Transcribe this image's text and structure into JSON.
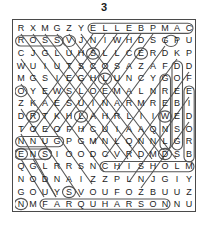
{
  "title": "3",
  "grid": {
    "rows": 15,
    "cols": 15,
    "letters": [
      [
        "R",
        "X",
        "M",
        "G",
        "Z",
        "Y",
        "E",
        "L",
        "L",
        "E",
        "B",
        "P",
        "M",
        "A",
        "C"
      ],
      [
        "R",
        "O",
        "S",
        "S",
        "V",
        "J",
        "N",
        "I",
        "W",
        "H",
        "D",
        "S",
        "G",
        "P",
        "U"
      ],
      [
        "C",
        "J",
        "G",
        "L",
        "U",
        "H",
        "S",
        "L",
        "L",
        "C",
        "E",
        "R",
        "D",
        "K",
        "P"
      ],
      [
        "W",
        "U",
        "I",
        "U",
        "T",
        "S",
        "C",
        "O",
        "S",
        "A",
        "Z",
        "A",
        "F",
        "D",
        "D"
      ],
      [
        "M",
        "G",
        "S",
        "I",
        "E",
        "G",
        "H",
        "L",
        "U",
        "N",
        "C",
        "Y",
        "G",
        "O",
        "F"
      ],
      [
        "O",
        "Y",
        "E",
        "W",
        "S",
        "L",
        "O",
        "E",
        "M",
        "A",
        "L",
        "N",
        "R",
        "E",
        "E"
      ],
      [
        "Z",
        "K",
        "A",
        "E",
        "S",
        "U",
        "I",
        "N",
        "A",
        "R",
        "M",
        "R",
        "E",
        "B",
        "I"
      ],
      [
        "D",
        "R",
        "T",
        "K",
        "H",
        "L",
        "A",
        "H",
        "R",
        "L",
        "I",
        "I",
        "W",
        "E",
        "D"
      ],
      [
        "T",
        "O",
        "E",
        "O",
        "F",
        "H",
        "C",
        "U",
        "I",
        "A",
        "A",
        "Q",
        "N",
        "S",
        "O"
      ],
      [
        "N",
        "N",
        "U",
        "G",
        "P",
        "G",
        "M",
        "N",
        "L",
        "Q",
        "N",
        "N",
        "L",
        "G",
        "R"
      ],
      [
        "E",
        "N",
        "S",
        "I",
        "O",
        "O",
        "D",
        "C",
        "V",
        "R",
        "D",
        "M",
        "D",
        "S",
        "B"
      ],
      [
        "Q",
        "G",
        "L",
        "R",
        "R",
        "S",
        "N",
        "C",
        "H",
        "I",
        "S",
        "H",
        "O",
        "L",
        "M"
      ],
      [
        "N",
        "O",
        "D",
        "N",
        "A",
        "I",
        "Z",
        "Z",
        "P",
        "L",
        "N",
        "J",
        "G",
        "I",
        "Y"
      ],
      [
        "G",
        "O",
        "U",
        "Y",
        "S",
        "V",
        "O",
        "U",
        "F",
        "O",
        "Z",
        "B",
        "U",
        "U",
        "Z"
      ],
      [
        "N",
        "M",
        "F",
        "A",
        "R",
        "Q",
        "U",
        "H",
        "A",
        "R",
        "S",
        "O",
        "N",
        "N",
        "U"
      ]
    ]
  },
  "found_words": [
    {
      "text": "CAMPBELL",
      "start_row": 0,
      "start_col": 14,
      "end_row": 0,
      "end_col": 6,
      "direction": "left"
    },
    {
      "text": "ROSS",
      "start_row": 1,
      "start_col": 0,
      "end_row": 1,
      "end_col": 3,
      "direction": "right"
    },
    {
      "text": "CHISHOLM",
      "start_row": 11,
      "start_col": 7,
      "end_row": 11,
      "end_col": 14,
      "direction": "right"
    },
    {
      "text": "FARQUHARSON",
      "start_row": 14,
      "start_col": 2,
      "end_row": 14,
      "end_col": 12,
      "direction": "right"
    },
    {
      "text": "GORDON",
      "start_row": 4,
      "start_col": 12,
      "end_row": 9,
      "end_col": 14,
      "direction": "down"
    },
    {
      "text": "FORBES",
      "start_row": 3,
      "start_col": 12,
      "end_row": 10,
      "end_col": 14,
      "direction": "down"
    },
    {
      "text": "ANDERSON",
      "start_row": 3,
      "start_col": 13,
      "end_row": 10,
      "end_col": 13,
      "direction": "down"
    },
    {
      "text": "NNUG",
      "start_row": 9,
      "start_col": 0,
      "end_row": 9,
      "end_col": 3,
      "direction": "right"
    },
    {
      "text": "ENS",
      "start_row": 10,
      "start_col": 0,
      "end_row": 10,
      "end_col": 2,
      "direction": "right"
    }
  ],
  "colors": {
    "ink": "#1c1c1c",
    "border": "#4a4a4a",
    "mark": "#555555",
    "paper": "#ffffff"
  },
  "icons": {
    "grid": "word-search-grid",
    "marks": "circled-word-marks"
  }
}
